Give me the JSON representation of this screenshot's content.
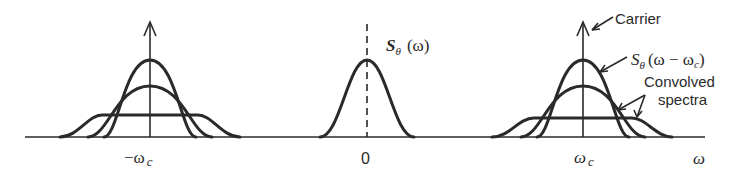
{
  "diagram": {
    "title": "",
    "axis_label": "ω",
    "tick_labels": {
      "left": "−ω",
      "left_sub": "c",
      "center": "0",
      "right": "ω",
      "right_sub": "c"
    },
    "annotations": {
      "center_spectrum": "S",
      "center_spectrum_sub": "θ",
      "center_spectrum_arg": "(ω)",
      "carrier": "Carrier",
      "shifted_spectrum": "S",
      "shifted_spectrum_sub": "θ",
      "shifted_spectrum_arg": "(ω − ω",
      "shifted_spectrum_arg_sub": "c",
      "shifted_spectrum_close": ")",
      "convolved_line1": "Convolved",
      "convolved_line2": "spectra"
    },
    "colors": {
      "ink": "#2a2a2a",
      "background": "#ffffff"
    }
  }
}
